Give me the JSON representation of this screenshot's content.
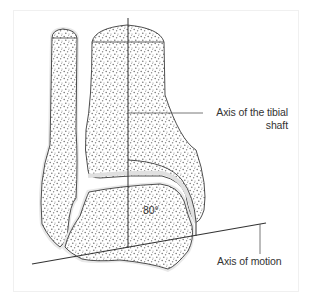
{
  "figure": {
    "type": "anatomical-diagram",
    "labels": {
      "tibial_axis_line1": "Axis of the tibial",
      "tibial_axis_line2": "shaft",
      "motion_axis": "Axis of motion",
      "angle": "80°"
    },
    "colors": {
      "outline": "#3a3a3a",
      "bone_fill": "#ffffff",
      "cartilage": "#e8e8e8",
      "stipple": "#7a7a7a",
      "axis_line": "#333333",
      "label_text": "#333333",
      "frame": "#f0f0f0"
    }
  }
}
